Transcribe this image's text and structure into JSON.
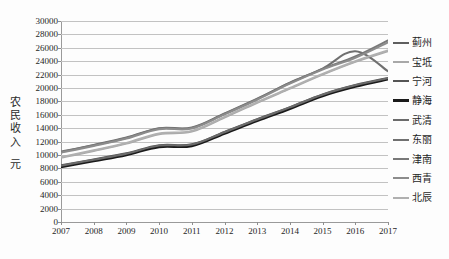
{
  "chart_data": {
    "type": "line",
    "title": "",
    "subtitle": "",
    "xlabel": "",
    "ylabel": "农民收入\n元",
    "ylabel_main": "农民收入",
    "ylabel_unit": "元",
    "grid": true,
    "legend_position": "right",
    "xlim": [
      2007,
      2017
    ],
    "ylim": [
      0,
      30000
    ],
    "ytick_step": 2000,
    "x": [
      2007,
      2008,
      2009,
      2010,
      2011,
      2012,
      2013,
      2014,
      2015,
      2016,
      2017
    ],
    "categories": [
      "2007",
      "2008",
      "2009",
      "2010",
      "2011",
      "2012",
      "2013",
      "2014",
      "2015",
      "2016",
      "2017"
    ],
    "ytick_labels": [
      "30000",
      "28000",
      "26000",
      "24000",
      "22000",
      "20000",
      "18000",
      "16000",
      "14000",
      "12000",
      "10000",
      "8000",
      "6000",
      "4000",
      "2000",
      "0"
    ],
    "series": [
      {
        "name": "蓟州",
        "color": "#5f5f5f",
        "width": 2.0,
        "values": [
          8300,
          9200,
          10100,
          11300,
          11450,
          13300,
          15200,
          17000,
          18900,
          20300,
          21400
        ]
      },
      {
        "name": "宝坻",
        "color": "#a8a8a8",
        "width": 2.0,
        "values": [
          9600,
          10600,
          11700,
          13100,
          13500,
          15600,
          17800,
          19900,
          22000,
          23900,
          25500
        ]
      },
      {
        "name": "宁河",
        "color": "#555555",
        "width": 2.0,
        "values": [
          8450,
          9350,
          10250,
          11450,
          11600,
          13450,
          15350,
          17150,
          19050,
          20450,
          21500
        ]
      },
      {
        "name": "静海",
        "color": "#1a1a1a",
        "width": 2.4,
        "values": [
          8200,
          9100,
          10000,
          11200,
          11350,
          13200,
          15100,
          16900,
          18800,
          20200,
          21300
        ]
      },
      {
        "name": "武清",
        "color": "#6b6b6b",
        "width": 2.0,
        "values": [
          8400,
          9300,
          10200,
          11400,
          11550,
          13400,
          15300,
          17100,
          19000,
          20400,
          21450
        ]
      },
      {
        "name": "东丽",
        "color": "#707070",
        "width": 2.0,
        "values": [
          10500,
          11500,
          12600,
          14000,
          14100,
          16200,
          18400,
          20800,
          22900,
          25500,
          22500
        ]
      },
      {
        "name": "津南",
        "color": "#787878",
        "width": 2.0,
        "values": [
          10450,
          11450,
          12550,
          13950,
          14050,
          16150,
          18350,
          20750,
          22850,
          24700,
          27100
        ]
      },
      {
        "name": "西青",
        "color": "#8c8c8c",
        "width": 2.0,
        "values": [
          10350,
          11350,
          12450,
          13850,
          13950,
          16050,
          18250,
          20650,
          22750,
          24500,
          26800
        ]
      },
      {
        "name": "北辰",
        "color": "#b0b0b0",
        "width": 2.0,
        "values": [
          9700,
          10700,
          11800,
          13200,
          13600,
          15700,
          17900,
          20000,
          22100,
          24000,
          25600
        ]
      }
    ]
  },
  "colors": {
    "gridline": "#c2c2c2",
    "axis": "#9a9a9a",
    "text": "#262626",
    "background": "#fdfdfd"
  }
}
